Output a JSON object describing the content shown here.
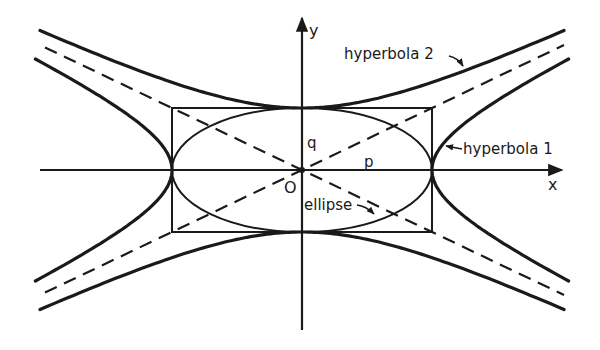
{
  "diagram": {
    "origin_px": [
      302,
      170
    ],
    "p": 130,
    "q": 62,
    "colors": {
      "ink": "#1a1a1a",
      "background": "#ffffff"
    },
    "axes": {
      "x_label": "x",
      "y_label": "y",
      "origin_label": "O",
      "x_range_px": [
        40,
        562
      ],
      "y_range_px": [
        18,
        330
      ]
    },
    "labels": {
      "q": "q",
      "p": "p",
      "hyperbola1": "hyperbola 1",
      "hyperbola2": "hyperbola 2",
      "ellipse": "ellipse"
    },
    "curves": [
      {
        "name": "ellipse",
        "equation": "x^2/p^2 + y^2/q^2 = 1",
        "style": "solid"
      },
      {
        "name": "hyperbola 1",
        "equation": "x^2/p^2 - y^2/q^2 = 1",
        "style": "solid-thick"
      },
      {
        "name": "hyperbola 2",
        "equation": "y^2/q^2 - x^2/p^2 = 1",
        "style": "solid-thick"
      },
      {
        "name": "asymptotes",
        "equation": "y = ±(q/p) x",
        "style": "dashed"
      },
      {
        "name": "rectangle",
        "equation": "|x| = p, |y| = q",
        "style": "solid"
      }
    ]
  }
}
